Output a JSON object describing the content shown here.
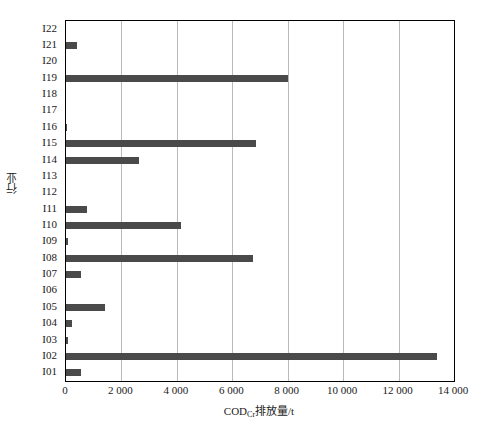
{
  "chart_data": {
    "type": "bar",
    "orientation": "horizontal",
    "title": "",
    "xlabel": "CODCr排放量/t",
    "xlabel_parts": {
      "base": "COD",
      "sub": "Cr",
      "tail": "排放量/t"
    },
    "ylabel": "行业",
    "categories": [
      "I01",
      "I02",
      "I03",
      "I04",
      "I05",
      "I06",
      "I07",
      "I08",
      "I09",
      "I10",
      "I11",
      "I12",
      "I13",
      "I14",
      "I15",
      "I16",
      "I17",
      "I18",
      "I19",
      "I20",
      "I21",
      "I22"
    ],
    "values": [
      540,
      13400,
      60,
      200,
      1400,
      0,
      540,
      6750,
      60,
      4150,
      750,
      0,
      0,
      2635,
      6860,
      50,
      0,
      0,
      8010,
      0,
      400,
      0
    ],
    "xlim": [
      0,
      14000
    ],
    "xticks": [
      0,
      2000,
      4000,
      6000,
      8000,
      10000,
      12000,
      14000
    ],
    "xtick_labels": [
      "0",
      "2 000",
      "4 000",
      "6 000",
      "8 000",
      "10 000",
      "12 000",
      "14 000"
    ],
    "grid": "vertical",
    "legend": "none",
    "bar_color": "#4a4a4a",
    "grid_color": "#b9b9b9",
    "axis_color": "#000000",
    "background": "#ffffff"
  }
}
